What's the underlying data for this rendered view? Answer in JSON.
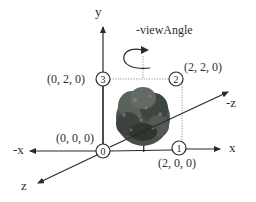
{
  "diagram": {
    "title": "-viewAngle",
    "axes": {
      "y": "y",
      "x": "x",
      "neg_x": "-x",
      "z": "z",
      "neg_z": "-z"
    },
    "vertices": [
      {
        "id": "0",
        "coord": "(0, 0, 0)"
      },
      {
        "id": "1",
        "coord": "(2, 0, 0)"
      },
      {
        "id": "2",
        "coord": "(2, 2, 0)"
      },
      {
        "id": "3",
        "coord": "(0, 2, 0)"
      }
    ],
    "rotation_label": "-viewAngle",
    "image": "tree",
    "colors": {
      "lines": "#2a2a2a",
      "dotted": "#888888",
      "tree_dark": "#2f3530",
      "tree_mid": "#5b625c",
      "tree_light": "#8a918b"
    }
  }
}
